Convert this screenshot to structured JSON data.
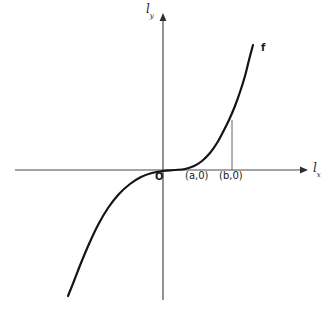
{
  "figure": {
    "width": 329,
    "height": 318,
    "background_color": "#ffffff"
  },
  "chart_data": {
    "type": "line",
    "title": "",
    "subtitle": "",
    "xlabel": "l_x",
    "ylabel": "l_y",
    "grid": false,
    "legend": "none",
    "axes": {
      "x_axis": {
        "label": "l",
        "subscript": "x",
        "arrow": "right",
        "pixel_y": 170,
        "pixel_x_start": 15,
        "pixel_x_end": 308
      },
      "y_axis": {
        "label": "l",
        "subscript": "y",
        "arrow": "up",
        "pixel_x": 163,
        "pixel_y_start": 13,
        "pixel_y_end": 300
      },
      "origin": {
        "label": "O",
        "pixel_x": 163,
        "pixel_y": 170
      }
    },
    "series": [
      {
        "name": "f",
        "label": "f",
        "color": "#141414",
        "stroke_width": 2.2,
        "points_px": [
          [
            68,
            296
          ],
          [
            74,
            281
          ],
          [
            81,
            263
          ],
          [
            89,
            244
          ],
          [
            98,
            225
          ],
          [
            108,
            208
          ],
          [
            119,
            194
          ],
          [
            130,
            184
          ],
          [
            141,
            177
          ],
          [
            152,
            173
          ],
          [
            163,
            171
          ],
          [
            174,
            170
          ],
          [
            185,
            169
          ],
          [
            194,
            166
          ],
          [
            202,
            161
          ],
          [
            210,
            153
          ],
          [
            217,
            143
          ],
          [
            223,
            132
          ],
          [
            229,
            120
          ],
          [
            235,
            106
          ],
          [
            240,
            92
          ],
          [
            245,
            76
          ],
          [
            249,
            60
          ],
          [
            253,
            45
          ]
        ]
      }
    ],
    "annotations": [
      {
        "name": "point-a",
        "text": "(a,0)",
        "x_value": "a",
        "y_value": 0,
        "pixel_x": 186,
        "pixel_y": 171
      },
      {
        "name": "point-b",
        "text": "(b,0)",
        "x_value": "b",
        "y_value": 0,
        "pixel_x": 219,
        "pixel_y": 171
      },
      {
        "name": "drop-line-b",
        "text": "",
        "pixel_x": 232,
        "pixel_y_top": 120,
        "pixel_y_bottom": 170,
        "color": "#555555"
      },
      {
        "name": "curve-label-f",
        "text": "f",
        "pixel_x": 262,
        "pixel_y": 48
      }
    ]
  },
  "labels": {
    "y_axis_letter": "l",
    "y_axis_subscript": "y",
    "x_axis_letter": "l",
    "x_axis_subscript": "x",
    "origin": "O",
    "point_a": "(a,0)",
    "point_b": "(b,0)",
    "curve_name": "f"
  },
  "colors": {
    "curve": "#141414",
    "axis": "#4a4a4a",
    "drop_line": "#666666",
    "text": "#1a1a1a",
    "background": "#ffffff"
  }
}
